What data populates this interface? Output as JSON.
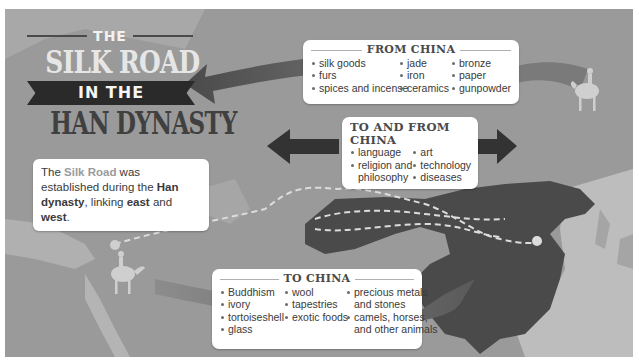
{
  "title": {
    "line1": "THE",
    "line2": "SILK ROAD",
    "line3": "IN THE",
    "line4": "HAN DYNASTY"
  },
  "intro": {
    "t1": "The ",
    "silk_road": "Silk Road",
    "t2": " was established during the ",
    "han_dynasty": "Han dynasty",
    "t3": ", linking ",
    "east": "east",
    "t4": " and ",
    "west": "west",
    "t5": "."
  },
  "from_china": {
    "heading": "FROM CHINA",
    "col1": [
      "silk goods",
      "furs",
      "spices and incense"
    ],
    "col2": [
      "jade",
      "iron",
      "ceramics"
    ],
    "col3": [
      "bronze",
      "paper",
      "gunpowder"
    ]
  },
  "to_and_from_china": {
    "heading": "TO AND FROM CHINA",
    "col1": [
      "language",
      "religion and",
      "philosophy"
    ],
    "col2": [
      "art",
      "technology",
      "diseases"
    ]
  },
  "to_china": {
    "heading": "TO CHINA",
    "col1": [
      "Buddhism",
      "ivory",
      "tortoiseshell",
      "glass"
    ],
    "col2": [
      "wool",
      "tapestries",
      "exotic foods"
    ],
    "col3": [
      "precious metals",
      "and stones",
      "camels, horses,",
      "and other animals"
    ]
  },
  "colors": {
    "background": "#9a9a9a",
    "han_territory": "#4a4a4a",
    "land_light": "#b8b8b8",
    "arrow_dark": "#3a3a3a",
    "arrow_mid": "#6a6a6a",
    "route_dashes": "#dcdcdc",
    "title_dark": "#404040",
    "highlight": "#9a9a9a"
  },
  "icons": {
    "camel_rider_east": "camel-rider",
    "camel_rider_west": "camel-rider"
  }
}
